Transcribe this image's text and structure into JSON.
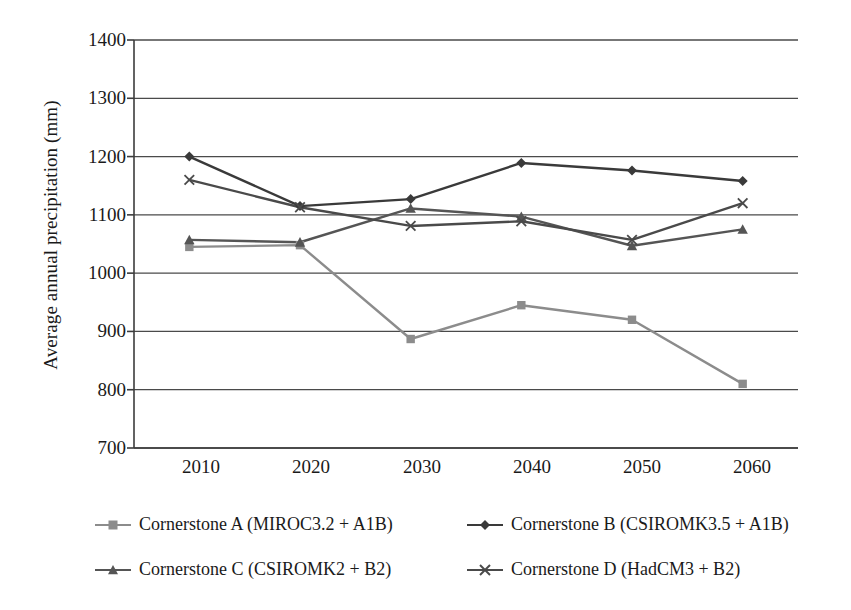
{
  "chart_data": {
    "type": "line",
    "title": "",
    "xlabel": "",
    "ylabel": "Average annual precipitation (mm)",
    "categories": [
      "2010",
      "2020",
      "2030",
      "2040",
      "2050",
      "2060"
    ],
    "x": [
      2010,
      2020,
      2030,
      2040,
      2050,
      2060
    ],
    "xlim": [
      2005,
      2065
    ],
    "ylim": [
      700,
      1400
    ],
    "yticks": [
      "700",
      "800",
      "900",
      "1000",
      "1100",
      "1200",
      "1300",
      "1400"
    ],
    "ytick_values": [
      700,
      800,
      900,
      1000,
      1100,
      1200,
      1300,
      1400
    ],
    "grid": "horizontal",
    "legend_position": "bottom",
    "series": [
      {
        "name": "Cornerstone A (MIROC3.2 + A1B)",
        "marker": "square",
        "color": "#8c8c8c",
        "values": [
          1045,
          1048,
          887,
          945,
          920,
          810
        ]
      },
      {
        "name": "Cornerstone B (CSIROMK3.5 + A1B)",
        "marker": "diamond",
        "color": "#3a3a3a",
        "values": [
          1200,
          1115,
          1127,
          1189,
          1176,
          1158
        ]
      },
      {
        "name": "Cornerstone C (CSIROMK2 + B2)",
        "marker": "triangle",
        "color": "#555555",
        "values": [
          1057,
          1053,
          1111,
          1097,
          1047,
          1075
        ]
      },
      {
        "name": "Cornerstone D (HadCM3 + B2)",
        "marker": "cross-x",
        "color": "#4a4a4a",
        "values": [
          1160,
          1113,
          1081,
          1089,
          1057,
          1120
        ]
      }
    ]
  },
  "axes": {
    "frame_color": "#3c3c3c",
    "grid_color": "#4a4a4a",
    "background": "#ffffff"
  }
}
